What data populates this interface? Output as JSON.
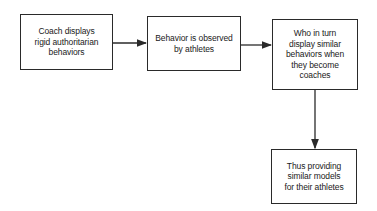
{
  "diagram": {
    "type": "flowchart",
    "nodes": [
      {
        "id": "n1",
        "label": "Coach displays\nrigid authoritarian\nbehaviors"
      },
      {
        "id": "n2",
        "label": "Behavior is observed\nby athletes"
      },
      {
        "id": "n3",
        "label": "Who in turn\ndisplay similar\nbehaviors when\nthey become\ncoaches"
      },
      {
        "id": "n4",
        "label": "Thus providing\nsimilar models\nfor their athletes"
      }
    ],
    "edges": [
      {
        "from": "n1",
        "to": "n2",
        "direction": "right"
      },
      {
        "from": "n2",
        "to": "n3",
        "direction": "right"
      },
      {
        "from": "n3",
        "to": "n4",
        "direction": "down"
      }
    ],
    "colors": {
      "line": "#2a2a2a",
      "background": "#ffffff"
    }
  }
}
